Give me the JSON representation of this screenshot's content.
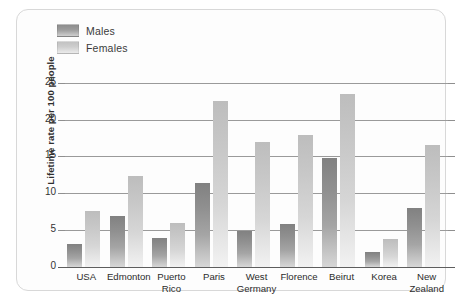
{
  "chart_data": {
    "type": "bar",
    "title": "",
    "xlabel": "",
    "ylabel": "Lifetime rate per 100 people",
    "ylim": [
      0,
      27
    ],
    "yticks": [
      0,
      5,
      10,
      15,
      20,
      25
    ],
    "grid": true,
    "legend_position": "top-left",
    "categories": [
      "USA",
      "Edmonton",
      "Puerto Rico",
      "Paris",
      "West Germany",
      "Florence",
      "Beirut",
      "Korea",
      "New Zealand"
    ],
    "category_lines": [
      [
        "USA"
      ],
      [
        "Edmonton"
      ],
      [
        "Puerto",
        "Rico"
      ],
      [
        "Paris"
      ],
      [
        "West",
        "Germany"
      ],
      [
        "Florence"
      ],
      [
        "Beirut"
      ],
      [
        "Korea"
      ],
      [
        "New",
        "Zealand"
      ]
    ],
    "series": [
      {
        "name": "Males",
        "color": "#8d8d8d",
        "values": [
          3.1,
          6.9,
          4.0,
          11.4,
          4.9,
          5.9,
          14.8,
          2.0,
          8.0
        ]
      },
      {
        "name": "Females",
        "color": "#c6c6c6",
        "values": [
          7.6,
          12.3,
          6.0,
          22.5,
          16.9,
          17.9,
          23.5,
          3.8,
          16.6
        ]
      }
    ]
  },
  "legend": {
    "items": [
      {
        "label": "Males",
        "swatch": "males-swatch"
      },
      {
        "label": "Females",
        "swatch": "females-swatch"
      }
    ]
  }
}
